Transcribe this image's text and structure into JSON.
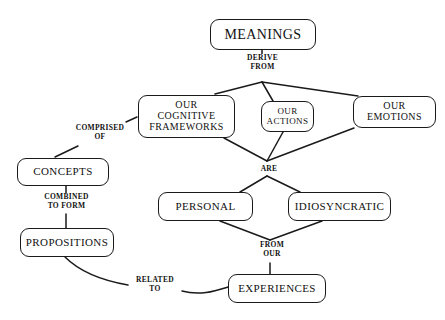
{
  "diagram": {
    "type": "concept-map",
    "background_color": "#ffffff",
    "line_color": "#1a1a1a",
    "text_color": "#111111",
    "nodes": [
      {
        "id": "meanings",
        "label": "MEANINGS",
        "lines": [
          "MEANINGS"
        ],
        "x": 210,
        "y": 19,
        "w": 106,
        "h": 31,
        "font_size": 14
      },
      {
        "id": "cognitive-frameworks",
        "label": "OUR COGNITIVE FRAMEWORKS",
        "lines": [
          "OUR",
          "COGNITIVE",
          "FRAMEWORKS"
        ],
        "x": 138,
        "y": 95,
        "w": 97,
        "h": 43,
        "font_size": 10
      },
      {
        "id": "actions",
        "label": "OUR ACTIONS",
        "lines": [
          "OUR",
          "ACTIONS"
        ],
        "x": 261,
        "y": 101,
        "w": 53,
        "h": 31,
        "font_size": 9
      },
      {
        "id": "emotions",
        "label": "OUR EMOTIONS",
        "lines": [
          "OUR",
          "EMOTIONS"
        ],
        "x": 353,
        "y": 96,
        "w": 83,
        "h": 32,
        "font_size": 10
      },
      {
        "id": "concepts",
        "label": "CONCEPTS",
        "lines": [
          "CONCEPTS"
        ],
        "x": 17,
        "y": 158,
        "w": 92,
        "h": 28,
        "font_size": 11
      },
      {
        "id": "propositions",
        "label": "PROPOSITIONS",
        "lines": [
          "PROPOSITIONS"
        ],
        "x": 20,
        "y": 228,
        "w": 94,
        "h": 29,
        "font_size": 11
      },
      {
        "id": "personal",
        "label": "PERSONAL",
        "lines": [
          "PERSONAL"
        ],
        "x": 158,
        "y": 192,
        "w": 95,
        "h": 29,
        "font_size": 11
      },
      {
        "id": "idiosyncratic",
        "label": "IDIOSYNCRATIC",
        "lines": [
          "IDIOSYNCRATIC"
        ],
        "x": 288,
        "y": 192,
        "w": 103,
        "h": 29,
        "font_size": 11
      },
      {
        "id": "experiences",
        "label": "EXPERIENCES",
        "lines": [
          "EXPERIENCES"
        ],
        "x": 228,
        "y": 274,
        "w": 98,
        "h": 29,
        "font_size": 11
      }
    ],
    "link_labels": [
      {
        "id": "derive-from",
        "text": "DERIVE FROM",
        "lines": [
          "DERIVE",
          "FROM"
        ],
        "from": "meanings",
        "to": [
          "cognitive-frameworks",
          "actions",
          "emotions"
        ],
        "x": 234,
        "y": 54,
        "w": 57,
        "font_size": 7.5
      },
      {
        "id": "comprised-of",
        "text": "COMPRISED OF",
        "lines": [
          "COMPRISED",
          "OF"
        ],
        "from": "cognitive-frameworks",
        "to": [
          "concepts"
        ],
        "x": 70,
        "y": 124,
        "w": 60,
        "font_size": 7.5
      },
      {
        "id": "combined-to-form",
        "text": "COMBINED TO FORM",
        "lines": [
          "COMBINED",
          "TO FORM"
        ],
        "from": "concepts",
        "to": [
          "propositions"
        ],
        "x": 35,
        "y": 193,
        "w": 63,
        "font_size": 7.5
      },
      {
        "id": "are",
        "text": "ARE",
        "lines": [
          "ARE"
        ],
        "from": [
          "cognitive-frameworks",
          "actions",
          "emotions"
        ],
        "to": [
          "personal",
          "idiosyncratic"
        ],
        "x": 256,
        "y": 165,
        "w": 26,
        "font_size": 7.5
      },
      {
        "id": "from-our",
        "text": "FROM OUR",
        "lines": [
          "FROM",
          "OUR"
        ],
        "from": [
          "personal",
          "idiosyncratic"
        ],
        "to": [
          "experiences"
        ],
        "x": 252,
        "y": 241,
        "w": 40,
        "font_size": 7.5
      },
      {
        "id": "related-to",
        "text": "RELATED TO",
        "lines": [
          "RELATED",
          "TO"
        ],
        "from": "propositions",
        "to": [
          "experiences"
        ],
        "x": 130,
        "y": 276,
        "w": 50,
        "font_size": 7.5
      }
    ],
    "edges": [
      {
        "id": "meanings-to-fan",
        "path": "M262,50 L262,56"
      },
      {
        "id": "fan-to-frameworks",
        "path": "M262,82 L215,94"
      },
      {
        "id": "fan-to-actions",
        "path": "M262,82 L273,101"
      },
      {
        "id": "fan-to-emotions",
        "path": "M262,82 L358,96"
      },
      {
        "id": "frameworks-to-are",
        "path": "M224,138 L267,161"
      },
      {
        "id": "actions-to-are",
        "path": "M283,132 L267,161"
      },
      {
        "id": "emotions-to-are",
        "path": "M354,128 L267,161"
      },
      {
        "id": "are-to-personal",
        "path": "M267,176 L240,192"
      },
      {
        "id": "are-to-idiosyncratic",
        "path": "M267,176 L300,192"
      },
      {
        "id": "personal-to-fromour",
        "path": "M220,221 L270,240"
      },
      {
        "id": "idiosyncratic-to-fromour",
        "path": "M322,221 L270,240"
      },
      {
        "id": "fromour-to-experiences",
        "path": "M270,263 L270,274"
      },
      {
        "id": "frameworks-to-comprised",
        "path": "M137,117 L126,122"
      },
      {
        "id": "comprised-to-concepts",
        "path": "M78,146 L55,157"
      },
      {
        "id": "concepts-to-combined",
        "path": "M66,186 L66,193"
      },
      {
        "id": "combined-to-propositions",
        "path": "M66,214 L66,228"
      },
      {
        "id": "propositions-to-related",
        "path": "M65,257 C80,272 105,281 128,285"
      },
      {
        "id": "related-to-experiences",
        "path": "M182,291 C200,296 215,291 228,287"
      }
    ]
  }
}
